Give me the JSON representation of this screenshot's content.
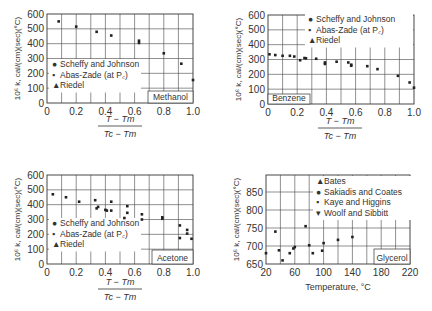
{
  "chart_data": [
    {
      "id": "methanol",
      "type": "scatter",
      "title": "Methanol",
      "xlabel": "(T - Tm)/(Tc - Tm)",
      "ylabel": "10^6 k, cal/(cm)(sec)(°C)",
      "xlim": [
        0,
        1.0
      ],
      "ylim": [
        0,
        600
      ],
      "xticks": [
        "0",
        "0.2",
        "0.4",
        "0.6",
        "0.8",
        "1.0"
      ],
      "yticks": [
        "0",
        "100",
        "200",
        "300",
        "400",
        "500",
        "600"
      ],
      "legend": [
        "Scheffy and Johnson",
        "Abas-Zade (at Pc)",
        "Riedel"
      ],
      "annotation": "Methanol",
      "points": [
        [
          0.08,
          550
        ],
        [
          0.2,
          515
        ],
        [
          0.34,
          480
        ],
        [
          0.44,
          455
        ],
        [
          0.63,
          420
        ],
        [
          0.63,
          405
        ],
        [
          0.8,
          335
        ],
        [
          0.92,
          265
        ],
        [
          1.0,
          155
        ]
      ]
    },
    {
      "id": "benzene",
      "type": "scatter",
      "title": "Benzene",
      "xlabel": "(T - Tm)/(Tc - Tm)",
      "ylabel": "10^6 k, cal/(cm)(sec)(°C)",
      "xlim": [
        0,
        1.0
      ],
      "ylim": [
        0,
        600
      ],
      "xticks": [
        "0",
        "0.2",
        "0.4",
        "0.6",
        "0.8",
        "1.0"
      ],
      "yticks": [
        "0",
        "100",
        "200",
        "300",
        "400",
        "500",
        "600"
      ],
      "legend": [
        "Scheffy and Johnson",
        "Abas-Zade (at Pc)",
        "Riedel"
      ],
      "annotation": "Benzene",
      "points": [
        [
          0.01,
          335
        ],
        [
          0.05,
          330
        ],
        [
          0.1,
          325
        ],
        [
          0.15,
          325
        ],
        [
          0.18,
          320
        ],
        [
          0.22,
          295
        ],
        [
          0.25,
          310
        ],
        [
          0.26,
          308
        ],
        [
          0.33,
          305
        ],
        [
          0.39,
          280
        ],
        [
          0.39,
          270
        ],
        [
          0.47,
          285
        ],
        [
          0.55,
          280
        ],
        [
          0.57,
          265
        ],
        [
          0.57,
          258
        ],
        [
          0.68,
          255
        ],
        [
          0.75,
          235
        ],
        [
          0.89,
          190
        ],
        [
          0.97,
          145
        ],
        [
          1.0,
          110
        ]
      ]
    },
    {
      "id": "acetone",
      "type": "scatter",
      "title": "Acetone",
      "xlabel": "(T - Tm)/(Tc - Tm)",
      "ylabel": "10^6 k, cal/(cm)(sec)(°C)",
      "xlim": [
        0,
        1.0
      ],
      "ylim": [
        0,
        600
      ],
      "xticks": [
        "0",
        "0.2",
        "0.4",
        "0.6",
        "0.8",
        "1.0"
      ],
      "yticks": [
        "0",
        "100",
        "200",
        "300",
        "400",
        "500",
        "600"
      ],
      "legend": [
        "Scheffy and Johnson",
        "Abas-Zade (at Pc)",
        "Riedel"
      ],
      "annotation": "Acetone",
      "points": [
        [
          0.04,
          470
        ],
        [
          0.13,
          450
        ],
        [
          0.22,
          420
        ],
        [
          0.33,
          430
        ],
        [
          0.35,
          385
        ],
        [
          0.34,
          375
        ],
        [
          0.4,
          365
        ],
        [
          0.41,
          360
        ],
        [
          0.44,
          420
        ],
        [
          0.44,
          360
        ],
        [
          0.53,
          310
        ],
        [
          0.55,
          390
        ],
        [
          0.55,
          345
        ],
        [
          0.65,
          335
        ],
        [
          0.65,
          300
        ],
        [
          0.79,
          315
        ],
        [
          0.79,
          305
        ],
        [
          0.91,
          260
        ],
        [
          0.91,
          175
        ],
        [
          0.96,
          230
        ],
        [
          0.96,
          205
        ],
        [
          0.99,
          170
        ]
      ]
    },
    {
      "id": "glycerol",
      "type": "scatter",
      "title": "Glycerol",
      "xlabel": "Temperature, °C",
      "ylabel": "10^6 k, cal/(cm)(sec)(°C)",
      "xlim": [
        20,
        220
      ],
      "ylim": [
        650,
        880
      ],
      "xticks": [
        "20",
        "60",
        "100",
        "140",
        "180",
        "220"
      ],
      "yticks": [
        "650",
        "700",
        "750",
        "800",
        "850"
      ],
      "legend": [
        "Bates",
        "Sakiadis and Coates",
        "Kaye and Higgins",
        "Woolf and Sibbitt"
      ],
      "annotation": "Glycerol",
      "points": [
        [
          20,
          680
        ],
        [
          33,
          740
        ],
        [
          38,
          688
        ],
        [
          43,
          660
        ],
        [
          53,
          680
        ],
        [
          58,
          693
        ],
        [
          60,
          697
        ],
        [
          75,
          755
        ],
        [
          80,
          702
        ],
        [
          85,
          680
        ],
        [
          98,
          687
        ],
        [
          100,
          708
        ],
        [
          120,
          717
        ],
        [
          140,
          725
        ]
      ]
    }
  ]
}
